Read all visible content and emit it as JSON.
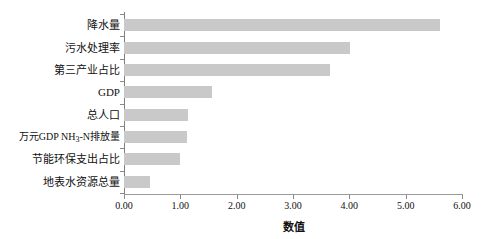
{
  "chart_data": {
    "type": "bar",
    "orientation": "horizontal",
    "title": "",
    "xlabel": "数值",
    "ylabel": "",
    "xlim": [
      0.0,
      6.0
    ],
    "xticks": [
      "0.00",
      "1.00",
      "2.00",
      "3.00",
      "4.00",
      "5.00",
      "6.00"
    ],
    "grid": false,
    "legend": null,
    "bar_color": "#c9c9c9",
    "categories": [
      "降水量",
      "污水处理率",
      "第三产业占比",
      "GDP",
      "总人口",
      "万元GDP NH3-N排放量",
      "节能环保支出占比",
      "地表水资源总量"
    ],
    "values": [
      5.61,
      4.01,
      3.66,
      1.56,
      1.14,
      1.12,
      1.0,
      0.46
    ]
  },
  "axis": {
    "x_title": "数值"
  },
  "categories_display": [
    {
      "label": "降水量",
      "sub": null,
      "label_after": null
    },
    {
      "label": "污水处理率",
      "sub": null,
      "label_after": null
    },
    {
      "label": "第三产业占比",
      "sub": null,
      "label_after": null
    },
    {
      "label": "GDP",
      "sub": null,
      "label_after": null
    },
    {
      "label": "总人口",
      "sub": null,
      "label_after": null
    },
    {
      "label": "万元GDP NH",
      "sub": "3",
      "label_after": "-N排放量"
    },
    {
      "label": "节能环保支出占比",
      "sub": null,
      "label_after": null
    },
    {
      "label": "地表水资源总量",
      "sub": null,
      "label_after": null
    }
  ]
}
